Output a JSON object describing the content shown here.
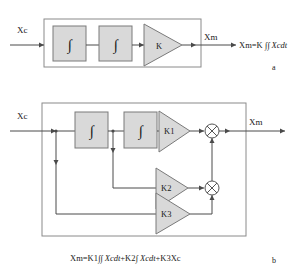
{
  "figure": {
    "panel_a": {
      "letter": "a",
      "input_label": "Xc",
      "output_label": "Xm",
      "equation": "Xm=K ",
      "equation_integral": "∫∫",
      "equation_tail": " Xcdt",
      "blocks": [
        {
          "name": "integrator-1",
          "symbol": "∫"
        },
        {
          "name": "integrator-2",
          "symbol": "∫"
        }
      ],
      "gain": {
        "name": "gain-k",
        "label": "K"
      }
    },
    "panel_b": {
      "letter": "b",
      "input_label": "Xc",
      "output_label": "Xm",
      "equation_p1": "Xm=K1",
      "equation_i1": "∫∫",
      "equation_p2": " Xcdt",
      "equation_p3": "+K2",
      "equation_i2": "∫",
      "equation_p4": " Xcdt",
      "equation_p5": "+K3Xc",
      "blocks": [
        {
          "name": "integrator-1",
          "symbol": "∫"
        },
        {
          "name": "integrator-2",
          "symbol": "∫"
        }
      ],
      "gains": [
        {
          "name": "gain-k1",
          "label": "K1"
        },
        {
          "name": "gain-k2",
          "label": "K2"
        },
        {
          "name": "gain-k3",
          "label": "K3"
        }
      ],
      "multipliers": [
        {
          "name": "multiplier-upper",
          "symbol": "⊗"
        },
        {
          "name": "multiplier-lower",
          "symbol": "⊗"
        }
      ]
    }
  },
  "colors": {
    "block_fill": "#d9d9d9",
    "block_stroke": "#7a7a7a",
    "wire": "#4a4a4a",
    "frame": "#8a8a8a",
    "text": "#1a1a1a",
    "background": "#ffffff"
  }
}
